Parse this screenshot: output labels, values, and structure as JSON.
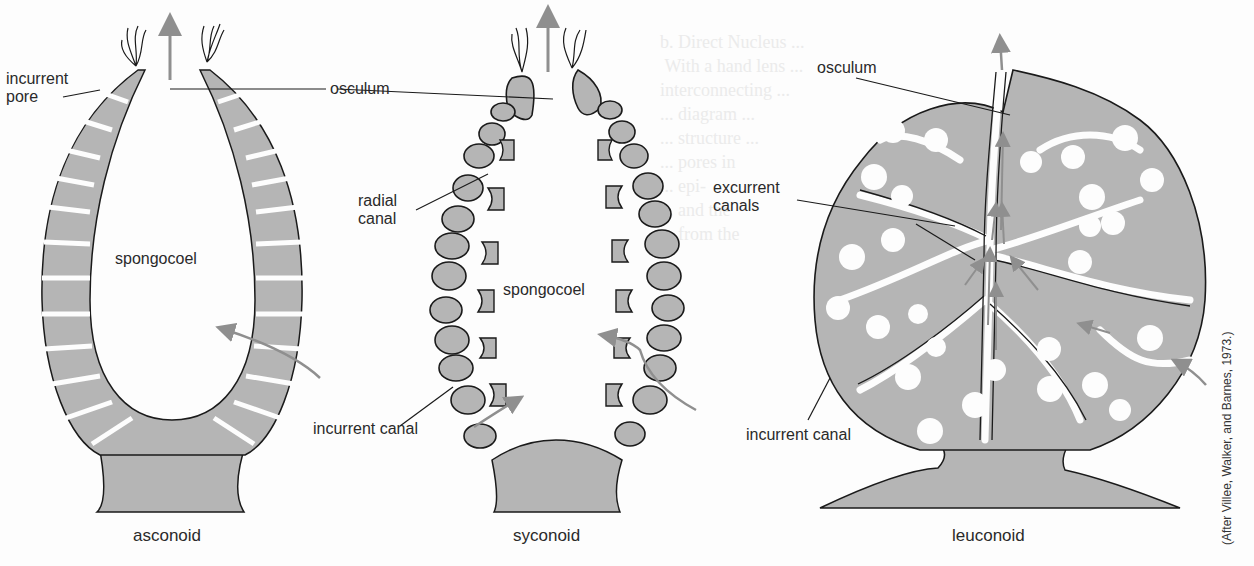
{
  "figure": {
    "credit": "(After Villee, Walker, and Barnes, 1973.)",
    "colors": {
      "tissue": "#b5b5b5",
      "outline": "#1a1a1a",
      "flow_arrow": "#8f8f8f",
      "background": "#fdfdfd"
    }
  },
  "asconoid": {
    "caption": "asconoid",
    "labels": {
      "incurrent_pore_1": "incurrent",
      "incurrent_pore_2": "pore",
      "osculum": "osculum",
      "spongocoel": "spongocoel"
    }
  },
  "syconoid": {
    "caption": "syconoid",
    "labels": {
      "radial_canal_1": "radial",
      "radial_canal_2": "canal",
      "spongocoel": "spongocoel",
      "incurrent_canal": "incurrent canal"
    }
  },
  "leuconoid": {
    "caption": "leuconoid",
    "labels": {
      "osculum": "osculum",
      "excurrent_canals_1": "excurrent",
      "excurrent_canals_2": "canals",
      "incurrent_canal": "incurrent canal"
    }
  }
}
